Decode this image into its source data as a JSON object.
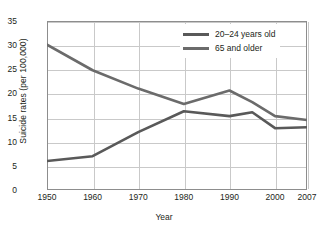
{
  "chart_data": {
    "type": "line",
    "title": "",
    "xlabel": "Year",
    "ylabel": "Suicide rates (per 100,000)",
    "x": [
      1950,
      1960,
      1970,
      1980,
      1990,
      1995,
      2000,
      2007
    ],
    "xticklabels": [
      "1950",
      "1960",
      "1970",
      "1980",
      "1990",
      "2000",
      "2007"
    ],
    "xtickvalues": [
      1950,
      1960,
      1970,
      1980,
      1990,
      2000,
      2007
    ],
    "yticklabels": [
      "0",
      "5",
      "10",
      "15",
      "20",
      "25",
      "30",
      "35"
    ],
    "ytickvalues": [
      0,
      5,
      10,
      15,
      20,
      25,
      30,
      35
    ],
    "xlim": [
      1950,
      2007
    ],
    "ylim": [
      0,
      35
    ],
    "grid": true,
    "legend_position": "upper-right",
    "series": [
      {
        "name": "20–24 years old",
        "color": "#595959",
        "x": [
          1950,
          1960,
          1970,
          1980,
          1990,
          1995,
          2000,
          2007
        ],
        "values": [
          6.0,
          7.0,
          12.0,
          16.3,
          15.3,
          16.1,
          12.8,
          13.0
        ]
      },
      {
        "name": "65 and older",
        "color": "#6b6b6b",
        "x": [
          1950,
          1960,
          1970,
          1980,
          1990,
          1995,
          2000,
          2007
        ],
        "values": [
          30.1,
          24.8,
          21.0,
          17.8,
          20.6,
          18.2,
          15.3,
          14.5
        ]
      }
    ]
  },
  "legend": {
    "items": [
      {
        "label": "20–24 years old",
        "color": "#595959"
      },
      {
        "label": "65 and older",
        "color": "#6b6b6b"
      }
    ]
  },
  "axes": {
    "x_title": "Year",
    "y_title": "Suicide rates (per 100,000)"
  }
}
